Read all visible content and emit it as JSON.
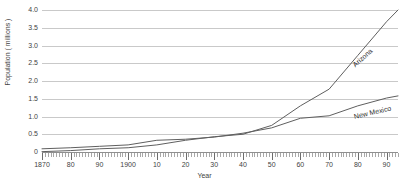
{
  "chart_data": {
    "type": "line",
    "title": "",
    "xlabel": "Year",
    "ylabel": "Population ( millions )",
    "xlim": [
      1870,
      1994
    ],
    "ylim": [
      0,
      4.0
    ],
    "grid": true,
    "legend_position": "inline-labels",
    "y_ticks": [
      "0",
      "0.5",
      "1.0",
      "1.5",
      "2.0",
      "2.5",
      "3.0",
      "3.5",
      "4.0"
    ],
    "y_tick_values": [
      0,
      0.5,
      1.0,
      1.5,
      2.0,
      2.5,
      3.0,
      3.5,
      4.0
    ],
    "x_ticks": [
      "1870",
      "80",
      "90",
      "1900",
      "10",
      "20",
      "30",
      "40",
      "50",
      "60",
      "70",
      "80",
      "90"
    ],
    "x_tick_values": [
      1870,
      1880,
      1890,
      1900,
      1910,
      1920,
      1930,
      1940,
      1950,
      1960,
      1970,
      1980,
      1990
    ],
    "series": [
      {
        "name": "Arizona",
        "label_angle": -42,
        "x": [
          1870,
          1880,
          1890,
          1900,
          1910,
          1920,
          1930,
          1940,
          1950,
          1960,
          1970,
          1980,
          1990,
          1994
        ],
        "values": [
          0.01,
          0.04,
          0.09,
          0.12,
          0.2,
          0.33,
          0.43,
          0.5,
          0.75,
          1.3,
          1.77,
          2.72,
          3.67,
          4.0
        ]
      },
      {
        "name": "New Mexico",
        "label_angle": -13,
        "x": [
          1870,
          1880,
          1890,
          1900,
          1910,
          1920,
          1930,
          1940,
          1950,
          1960,
          1970,
          1980,
          1990,
          1994
        ],
        "values": [
          0.09,
          0.12,
          0.16,
          0.2,
          0.33,
          0.36,
          0.42,
          0.53,
          0.68,
          0.95,
          1.02,
          1.3,
          1.52,
          1.58
        ]
      }
    ]
  },
  "style": {
    "grid_color": "#c9c9c9",
    "axis_color": "#8f8f8f",
    "series_color": "#5f5f5f",
    "text_color": "#3f3f3f",
    "background": "#ffffff"
  }
}
